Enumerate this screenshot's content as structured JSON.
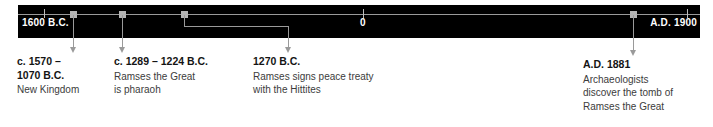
{
  "figure": {
    "kind": "historical-timeline",
    "background_color": "#ffffff",
    "band_color": "#000000",
    "rule_color": "#9a9a9a",
    "marker_color": "#b4b4b4",
    "band_label_color": "#ffffff",
    "date_text_color": "#141414",
    "desc_text_color": "#3c3c3c"
  },
  "axis": {
    "labels": [
      {
        "text": "1600 B.C.",
        "align": "left"
      },
      {
        "text": "0",
        "align": "center"
      },
      {
        "text": "A.D. 1900",
        "align": "right"
      }
    ]
  },
  "events": [
    {
      "date": "c. 1570 –\n1070 B.C.",
      "description": "New Kingdom"
    },
    {
      "date": "c. 1289 – 1224 B.C.",
      "description": "Ramses the Great\nis pharaoh"
    },
    {
      "date": "1270 B.C.",
      "description": "Ramses signs peace treaty\nwith the Hittites"
    },
    {
      "date": "A.D. 1881",
      "description": "Archaeologists\ndiscover the tomb of\nRamses the Great"
    }
  ]
}
